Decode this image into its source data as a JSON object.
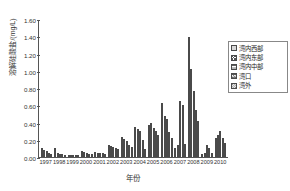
{
  "chart_data": {
    "type": "bar",
    "title": "",
    "xlabel": "年份",
    "ylabel": "溶解硅酸盐/(mg/L)",
    "ylim": [
      0.0,
      1.6
    ],
    "ytick_labels": [
      "0.00",
      "0.20",
      "0.40",
      "0.60",
      "0.80",
      "1.00",
      "1.20",
      "1.40",
      "1.60"
    ],
    "ytick_values": [
      0.0,
      0.2,
      0.4,
      0.6,
      0.8,
      1.0,
      1.2,
      1.4,
      1.6
    ],
    "grid": false,
    "legend_position": "top-right",
    "categories": [
      "1997",
      "1998",
      "1999",
      "2000",
      "2001",
      "2002",
      "2003",
      "2004",
      "2005",
      "2006",
      "2007",
      "2008",
      "2009",
      "2010"
    ],
    "series": [
      {
        "name": "湾内西部",
        "pattern": "solid-gray",
        "values": [
          0.1,
          0.11,
          0.02,
          0.07,
          0.06,
          0.14,
          0.23,
          0.35,
          0.37,
          0.63,
          0.1,
          1.39,
          0.04,
          0.22
        ]
      },
      {
        "name": "湾内东部",
        "pattern": "cross-hatch",
        "values": [
          0.08,
          0.05,
          0.02,
          0.06,
          0.05,
          0.13,
          0.21,
          0.33,
          0.39,
          0.48,
          0.14,
          1.02,
          0.05,
          0.25
        ]
      },
      {
        "name": "湾内中部",
        "pattern": "horizontal-lines",
        "values": [
          0.07,
          0.04,
          0.02,
          0.05,
          0.05,
          0.12,
          0.18,
          0.3,
          0.34,
          0.44,
          0.65,
          0.77,
          0.14,
          0.3
        ]
      },
      {
        "name": "湾口",
        "pattern": "grid-hatch",
        "values": [
          0.05,
          0.03,
          0.015,
          0.04,
          0.05,
          0.11,
          0.14,
          0.2,
          0.3,
          0.29,
          0.6,
          0.55,
          0.1,
          0.22
        ]
      },
      {
        "name": "湾外",
        "pattern": "diagonal-hatch",
        "values": [
          0.04,
          0.02,
          0.01,
          0.035,
          0.04,
          0.09,
          0.12,
          0.09,
          0.26,
          0.22,
          0.15,
          0.42,
          0.05,
          0.16
        ]
      }
    ]
  }
}
